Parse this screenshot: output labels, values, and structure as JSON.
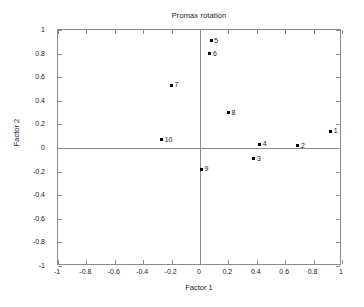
{
  "chart_data": {
    "type": "scatter",
    "title": "Promax rotation",
    "xlabel": "Factor 1",
    "ylabel": "Factor 2",
    "xlim": [
      -1,
      1
    ],
    "ylim": [
      -1,
      1
    ],
    "grid": false,
    "legend": null,
    "xticks": [
      "-1",
      "-0.8",
      "-0.6",
      "-0.4",
      "-0.2",
      "0",
      "0.2",
      "0.4",
      "0.6",
      "0.8",
      "1"
    ],
    "xtickvalues": [
      -1,
      -0.8,
      -0.6,
      -0.4,
      -0.2,
      0,
      0.2,
      0.4,
      0.6,
      0.8,
      1
    ],
    "yticks": [
      "1",
      "0.8",
      "0.6",
      "0.4",
      "0.2",
      "0",
      "-0.2",
      "-0.4",
      "-0.6",
      "-0.8",
      "-1"
    ],
    "ytickvalues": [
      1,
      0.8,
      0.6,
      0.4,
      0.2,
      0,
      -0.2,
      -0.4,
      -0.6,
      -0.8,
      -1
    ],
    "zero_lines": true,
    "marker_color": "#000000",
    "axis_color": "#8a8a8a",
    "points": [
      {
        "label": "1",
        "x": 0.92,
        "y": 0.14
      },
      {
        "label": "2",
        "x": 0.69,
        "y": 0.02
      },
      {
        "label": "3",
        "x": 0.38,
        "y": -0.09
      },
      {
        "label": "4",
        "x": 0.42,
        "y": 0.03
      },
      {
        "label": "5",
        "x": 0.08,
        "y": 0.91
      },
      {
        "label": "6",
        "x": 0.07,
        "y": 0.8
      },
      {
        "label": "7",
        "x": -0.2,
        "y": 0.53
      },
      {
        "label": "8",
        "x": 0.2,
        "y": 0.3
      },
      {
        "label": "9",
        "x": 0.01,
        "y": -0.18
      },
      {
        "label": "10",
        "x": -0.27,
        "y": 0.07
      }
    ]
  }
}
